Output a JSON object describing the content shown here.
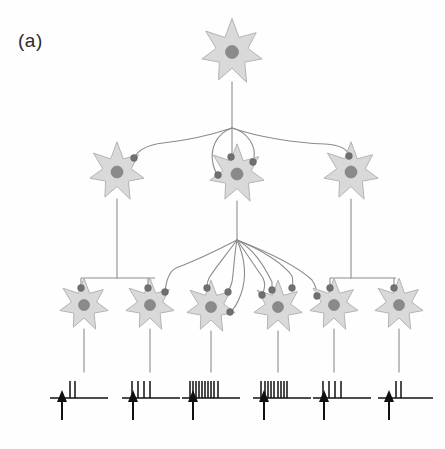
{
  "figure": {
    "panel_label": "(a)",
    "diagram_type": "neural-circuit-schematic",
    "background_color": "#fefefe"
  },
  "colors": {
    "soma_fill": "#d9d9d9",
    "soma_stroke": "#b4b4b4",
    "nucleus_fill": "#8a8a8a",
    "axon_stroke": "#8c8c8c",
    "bouton_fill": "#707070",
    "spike_color": "#111111"
  },
  "layers": [
    {
      "name": "layer-1",
      "role": "top-input-neuron",
      "count": 1,
      "neurons": [
        {
          "id": "n1-1",
          "cx": 232,
          "cy": 52,
          "r": 30,
          "nucleus_r": 6.5,
          "boutons": []
        }
      ]
    },
    {
      "name": "layer-2",
      "role": "intermediate-neurons",
      "count": 3,
      "neurons": [
        {
          "id": "n2-1",
          "cx": 117,
          "cy": 172,
          "r": 27,
          "nucleus_r": 6,
          "boutons": [
            {
              "x": 134,
              "y": 158
            }
          ]
        },
        {
          "id": "n2-2",
          "cx": 237,
          "cy": 174,
          "r": 27,
          "nucleus_r": 6,
          "boutons": [
            {
              "x": 231,
              "y": 157
            },
            {
              "x": 253,
              "y": 162
            },
            {
              "x": 218,
              "y": 175
            }
          ]
        },
        {
          "id": "n2-3",
          "cx": 351,
          "cy": 172,
          "r": 27,
          "nucleus_r": 6,
          "boutons": [
            {
              "x": 349,
              "y": 156
            }
          ]
        }
      ]
    },
    {
      "name": "layer-3",
      "role": "output-neurons",
      "count": 6,
      "neurons": [
        {
          "id": "n3-1",
          "cx": 84,
          "cy": 305,
          "r": 24,
          "nucleus_r": 5.5,
          "boutons": [
            {
              "x": 81,
              "y": 288
            }
          ]
        },
        {
          "id": "n3-2",
          "cx": 150,
          "cy": 305,
          "r": 24,
          "nucleus_r": 5.5,
          "boutons": [
            {
              "x": 148,
              "y": 288
            },
            {
              "x": 165,
              "y": 292
            }
          ]
        },
        {
          "id": "n3-3",
          "cx": 211,
          "cy": 307,
          "r": 24,
          "nucleus_r": 5.5,
          "boutons": [
            {
              "x": 207,
              "y": 288
            },
            {
              "x": 228,
              "y": 292
            },
            {
              "x": 230,
              "y": 312
            }
          ]
        },
        {
          "id": "n3-4",
          "cx": 278,
          "cy": 307,
          "r": 24,
          "nucleus_r": 5.5,
          "boutons": [
            {
              "x": 272,
              "y": 290
            },
            {
              "x": 292,
              "y": 288
            },
            {
              "x": 262,
              "y": 295
            }
          ]
        },
        {
          "id": "n3-5",
          "cx": 334,
          "cy": 305,
          "r": 24,
          "nucleus_r": 5.5,
          "boutons": [
            {
              "x": 330,
              "y": 288
            },
            {
              "x": 317,
              "y": 296
            }
          ]
        },
        {
          "id": "n3-6",
          "cx": 399,
          "cy": 305,
          "r": 24,
          "nucleus_r": 5.5,
          "boutons": [
            {
              "x": 394,
              "y": 288
            }
          ]
        }
      ]
    }
  ],
  "chart_data": {
    "type": "raster",
    "annotation": "Upward arrow marks stimulus onset beneath each trace",
    "xlabel": "",
    "ylabel": "",
    "categories": [
      "n3-1",
      "n3-2",
      "n3-3",
      "n3-4",
      "n3-5",
      "n3-6"
    ],
    "values": [
      2,
      4,
      10,
      9,
      4,
      2
    ],
    "traces": [
      {
        "neuron": "n3-1",
        "spike_count": 2,
        "baseline_x": 50,
        "baseline_y": 398,
        "baseline_w": 58,
        "arrow_x": 62,
        "spike_offsets": [
          20,
          25
        ]
      },
      {
        "neuron": "n3-2",
        "spike_count": 4,
        "baseline_x": 122,
        "baseline_y": 398,
        "baseline_w": 58,
        "arrow_x": 133,
        "spike_offsets": [
          10,
          16,
          22,
          28
        ]
      },
      {
        "neuron": "n3-3",
        "spike_count": 10,
        "baseline_x": 182,
        "baseline_y": 398,
        "baseline_w": 58,
        "arrow_x": 193,
        "spike_offsets": [
          8,
          11,
          14,
          17,
          20,
          23,
          26,
          29,
          32,
          36
        ]
      },
      {
        "neuron": "n3-4",
        "spike_count": 9,
        "baseline_x": 253,
        "baseline_y": 398,
        "baseline_w": 58,
        "arrow_x": 264,
        "spike_offsets": [
          8,
          12,
          15,
          18,
          21,
          25,
          28,
          31,
          34
        ]
      },
      {
        "neuron": "n3-5",
        "spike_count": 4,
        "baseline_x": 313,
        "baseline_y": 398,
        "baseline_w": 58,
        "arrow_x": 324,
        "spike_offsets": [
          10,
          16,
          22,
          28
        ]
      },
      {
        "neuron": "n3-6",
        "spike_count": 2,
        "baseline_x": 378,
        "baseline_y": 398,
        "baseline_w": 55,
        "arrow_x": 389,
        "spike_offsets": [
          18,
          23
        ]
      }
    ]
  }
}
